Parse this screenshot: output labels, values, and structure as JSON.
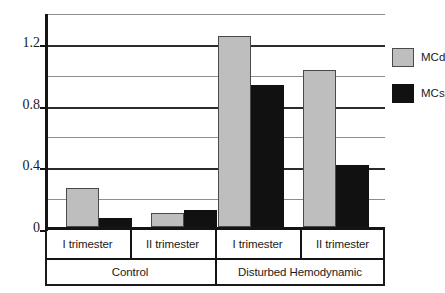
{
  "chart_data": {
    "type": "bar",
    "title": "",
    "xlabel": "",
    "ylabel": "",
    "ylim": [
      0,
      1.4
    ],
    "grid": true,
    "gridlines_major": [
      0,
      0.4,
      0.8,
      1.2
    ],
    "gridlines_minor": [
      0.2,
      0.6,
      1.0,
      1.4
    ],
    "ytick_labels": [
      "0",
      "0.4",
      "0.8",
      "1.2"
    ],
    "ytick_values": [
      0,
      0.4,
      0.8,
      1.2
    ],
    "categories": [
      "I trimester",
      "II trimester",
      "I trimester",
      "II trimester"
    ],
    "group_labels": [
      "Control",
      "Disturbed Hemodynamic"
    ],
    "legend_position": "right",
    "series": [
      {
        "name": "MCd",
        "color": "#bebebe",
        "values": [
          0.25,
          0.09,
          1.24,
          1.02
        ]
      },
      {
        "name": "MCs",
        "color": "#111111",
        "values": [
          0.06,
          0.11,
          0.92,
          0.4
        ]
      }
    ]
  },
  "legend": {
    "items": [
      {
        "label": "MCd",
        "swatch": "gray-swatch"
      },
      {
        "label": "MCs",
        "swatch": "black-swatch"
      }
    ]
  },
  "axis": {
    "y_labels": [
      "1.2",
      "0.8",
      "0.4",
      "0"
    ]
  },
  "xaxis": {
    "cells": [
      "I trimester",
      "II trimester",
      "I trimester",
      "II trimester"
    ],
    "groups": [
      "Control",
      "Disturbed Hemodynamic"
    ]
  }
}
